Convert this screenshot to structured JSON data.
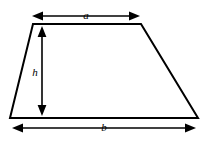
{
  "figure": {
    "background_color": "#ffffff",
    "stroke_color": "#000000",
    "shape": {
      "name": "trapezoid",
      "top_edge": {
        "x1": 33,
        "y1": 24,
        "x2": 141,
        "y2": 24
      },
      "bottom_edge": {
        "x1": 10,
        "y1": 118,
        "x2": 198,
        "y2": 118
      },
      "left_edge": {
        "x1": 33,
        "y1": 24,
        "x2": 10,
        "y2": 118
      },
      "right_edge": {
        "x1": 141,
        "y1": 24,
        "x2": 198,
        "y2": 118
      }
    },
    "dimensions": [
      {
        "id": "a",
        "label": "a",
        "meaning": "top parallel side length",
        "orientation": "horizontal",
        "from": {
          "x": 32,
          "y": 16
        },
        "to": {
          "x": 140,
          "y": 16
        },
        "label_position": {
          "x": 86,
          "y": 19
        },
        "double_headed": true
      },
      {
        "id": "h",
        "label": "h",
        "meaning": "height",
        "orientation": "vertical",
        "from": {
          "x": 42,
          "y": 26
        },
        "to": {
          "x": 42,
          "y": 116
        },
        "label_position": {
          "x": 35,
          "y": 75
        },
        "double_headed": true
      },
      {
        "id": "b",
        "label": "b",
        "meaning": "bottom parallel side length",
        "orientation": "horizontal",
        "from": {
          "x": 12,
          "y": 128
        },
        "to": {
          "x": 196,
          "y": 128
        },
        "label_position": {
          "x": 104,
          "y": 131
        },
        "double_headed": true
      }
    ]
  }
}
